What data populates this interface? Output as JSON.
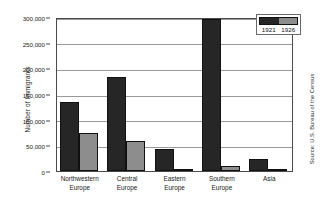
{
  "chart_data": {
    "type": "bar",
    "title": "",
    "xlabel": "",
    "ylabel": "Number of Immigrants",
    "categories": [
      "Northwestern Europe",
      "Central Europe",
      "Eastern Europe",
      "Southern Europe",
      "Asia"
    ],
    "category_lines": [
      [
        "Northwestern",
        "Europe"
      ],
      [
        "Central",
        "Europe"
      ],
      [
        "Eastern",
        "Europe"
      ],
      [
        "Southern",
        "Europe"
      ],
      [
        "Asia"
      ]
    ],
    "series": [
      {
        "name": "1921",
        "color": "#262626",
        "values": [
          135000,
          183000,
          43000,
          297000,
          23000
        ]
      },
      {
        "name": "1926",
        "color": "#8d8d8d",
        "values": [
          74000,
          58000,
          4000,
          9000,
          2000
        ]
      }
    ],
    "ylim": [
      0,
      300000
    ],
    "ytick_values": [
      0,
      50000,
      100000,
      150000,
      200000,
      250000,
      300000
    ],
    "ytick_labels": [
      "0",
      "50,000",
      "100,000",
      "150,000",
      "200,000",
      "250,000",
      "300,000"
    ],
    "grid": true,
    "legend_position": "top-right",
    "annotations": [
      "Source: U.S. Bureau of the Census"
    ]
  },
  "legend": {
    "entries": [
      {
        "label": "1921",
        "color": "#262626"
      },
      {
        "label": "1926",
        "color": "#8d8d8d"
      }
    ]
  },
  "source": {
    "text": "Source: U.S. Bureau of the Census"
  }
}
